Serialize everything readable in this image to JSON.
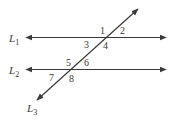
{
  "diagram": {
    "lines": [
      {
        "id": "L1",
        "letter": "L",
        "subscript": "1",
        "kind": "parallel"
      },
      {
        "id": "L2",
        "letter": "L",
        "subscript": "2",
        "kind": "parallel"
      },
      {
        "id": "L3",
        "letter": "L",
        "subscript": "3",
        "kind": "transversal"
      }
    ],
    "angles": [
      {
        "label": "1",
        "at": "L1",
        "position": "above-left"
      },
      {
        "label": "2",
        "at": "L1",
        "position": "above-right"
      },
      {
        "label": "3",
        "at": "L1",
        "position": "below-left"
      },
      {
        "label": "4",
        "at": "L1",
        "position": "below-right"
      },
      {
        "label": "5",
        "at": "L2",
        "position": "above-left"
      },
      {
        "label": "6",
        "at": "L2",
        "position": "above-right"
      },
      {
        "label": "7",
        "at": "L2",
        "position": "below-left"
      },
      {
        "label": "8",
        "at": "L2",
        "position": "below-right"
      }
    ],
    "stroke_color": "#3a3a3a"
  }
}
